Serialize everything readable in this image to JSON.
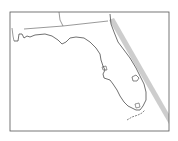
{
  "map": {
    "region": "Florida",
    "frame": {
      "x": 10,
      "y": 12,
      "width": 159,
      "height": 119,
      "color": "#555555"
    },
    "colors": {
      "coastline": "#333333",
      "state_border": "#444444",
      "track_band": "#c8c8c8",
      "background": "#ffffff"
    },
    "features": [
      "state-borders",
      "coastline",
      "lake-okeechobee",
      "track-band"
    ]
  }
}
